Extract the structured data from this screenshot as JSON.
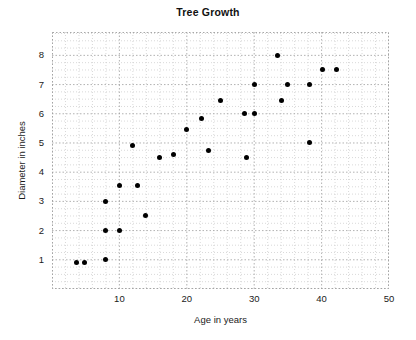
{
  "chart_data": {
    "type": "scatter",
    "title": "Tree Growth",
    "xlabel": "Age in years",
    "ylabel": "Diameter in inches",
    "xlim": [
      0,
      50
    ],
    "ylim": [
      0,
      8.8
    ],
    "xticks": [
      10,
      20,
      30,
      40,
      50
    ],
    "yticks": [
      1,
      2,
      3,
      4,
      5,
      6,
      7,
      8
    ],
    "grid": true,
    "grid_style": "dotted",
    "legend": null,
    "marker": {
      "shape": "circle",
      "color": "#000000",
      "size": 5
    },
    "points": [
      {
        "x": 3.7,
        "y": 0.92
      },
      {
        "x": 4.8,
        "y": 0.92
      },
      {
        "x": 8.0,
        "y": 1.0
      },
      {
        "x": 8.0,
        "y": 2.0
      },
      {
        "x": 10.0,
        "y": 2.0
      },
      {
        "x": 13.8,
        "y": 2.5
      },
      {
        "x": 8.0,
        "y": 3.0
      },
      {
        "x": 10.0,
        "y": 3.55
      },
      {
        "x": 12.7,
        "y": 3.55
      },
      {
        "x": 12.0,
        "y": 4.9
      },
      {
        "x": 16.0,
        "y": 4.5
      },
      {
        "x": 18.0,
        "y": 4.6
      },
      {
        "x": 20.0,
        "y": 5.45
      },
      {
        "x": 22.2,
        "y": 5.85
      },
      {
        "x": 23.2,
        "y": 4.75
      },
      {
        "x": 25.0,
        "y": 6.45
      },
      {
        "x": 28.5,
        "y": 6.0
      },
      {
        "x": 28.8,
        "y": 4.5
      },
      {
        "x": 30.0,
        "y": 6.0
      },
      {
        "x": 30.0,
        "y": 7.0
      },
      {
        "x": 33.4,
        "y": 8.0
      },
      {
        "x": 34.0,
        "y": 6.45
      },
      {
        "x": 35.0,
        "y": 7.0
      },
      {
        "x": 38.2,
        "y": 5.0
      },
      {
        "x": 38.2,
        "y": 7.0
      },
      {
        "x": 40.2,
        "y": 7.5
      },
      {
        "x": 42.2,
        "y": 7.5
      }
    ]
  },
  "colors": {
    "background": "#ffffff",
    "marker": "#000000",
    "grid": "#bdbdbd",
    "text": "#1a1a1a"
  }
}
